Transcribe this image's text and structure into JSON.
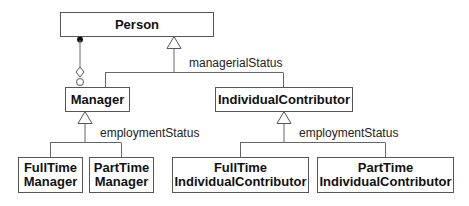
{
  "diagram": {
    "type": "UML class diagram",
    "classes": {
      "person": "Person",
      "manager": "Manager",
      "individual_contributor": "IndividualContributor",
      "fulltime_manager": [
        "FullTime",
        "Manager"
      ],
      "parttime_manager": [
        "PartTime",
        "Manager"
      ],
      "fulltime_ic": [
        "FullTime",
        "IndividualContributor"
      ],
      "parttime_ic": [
        "PartTime",
        "IndividualContributor"
      ]
    },
    "discriminators": {
      "person": "managerialStatus",
      "manager": "employmentStatus",
      "individual_contributor": "employmentStatus"
    },
    "relationships": [
      {
        "type": "generalization",
        "parent": "Person",
        "children": [
          "Manager",
          "IndividualContributor"
        ],
        "label": "managerialStatus"
      },
      {
        "type": "generalization",
        "parent": "Manager",
        "children": [
          "FullTime Manager",
          "PartTime Manager"
        ],
        "label": "employmentStatus"
      },
      {
        "type": "generalization",
        "parent": "IndividualContributor",
        "children": [
          "FullTime IndividualContributor",
          "PartTime IndividualContributor"
        ],
        "label": "employmentStatus"
      },
      {
        "type": "aggregation",
        "from": "Person",
        "to": "Manager"
      }
    ]
  }
}
